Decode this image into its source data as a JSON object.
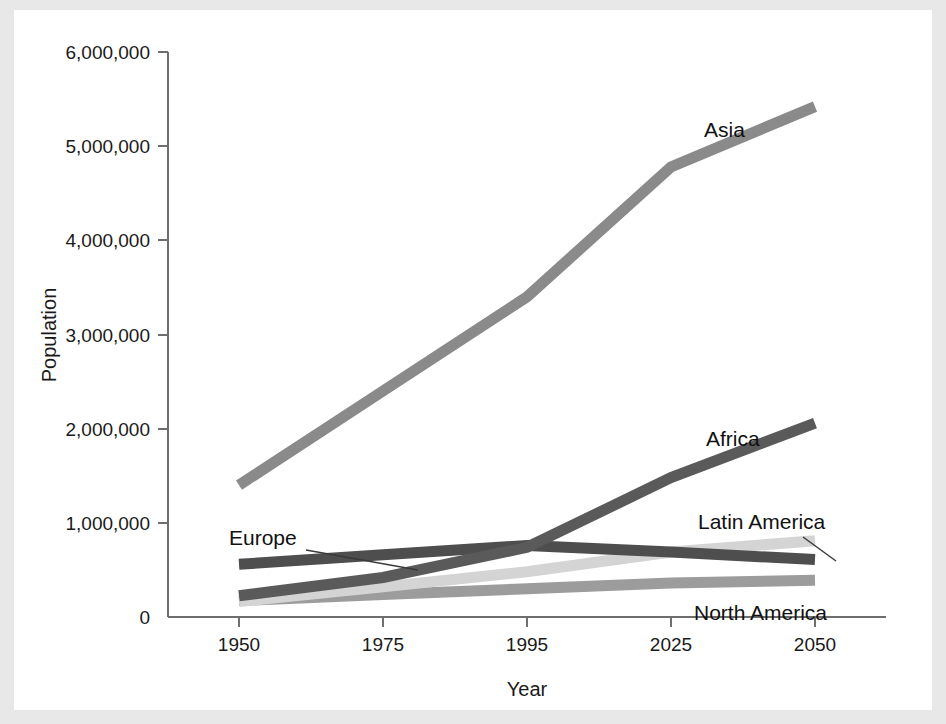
{
  "figure": {
    "background": "#ffffff",
    "page_background": "#e8e8e8"
  },
  "axes": {
    "x_title": "Year",
    "y_title": "Population",
    "x_ticks": [
      "1950",
      "1975",
      "1995",
      "2025",
      "2050"
    ],
    "y_ticks": [
      "0",
      "1,000,000",
      "2,000,000",
      "3,000,000",
      "4,000,000",
      "5,000,000",
      "6,000,000"
    ]
  },
  "labels": {
    "asia": "Asia",
    "africa": "Africa",
    "europe": "Europe",
    "latin_america": "Latin America",
    "north_america": "North America"
  },
  "colors": {
    "asia": "#8a8a8a",
    "africa": "#5a5a5a",
    "europe": "#4e4e4e",
    "latin_america": "#d4d4d4",
    "north_america": "#9c9c9c",
    "axis": "#6e6e6e",
    "text": "#111111"
  },
  "chart_data": {
    "type": "line",
    "title": "",
    "xlabel": "Year",
    "ylabel": "Population",
    "x": [
      1950,
      1975,
      1995,
      2025,
      2050
    ],
    "x_positions_categorical": true,
    "xtick_labels": [
      "1950",
      "1975",
      "1995",
      "2025",
      "2050"
    ],
    "ylim": [
      0,
      6000000
    ],
    "ytick_values": [
      0,
      1000000,
      2000000,
      3000000,
      4000000,
      5000000,
      6000000
    ],
    "grid": false,
    "legend": "inline-labels",
    "series": [
      {
        "name": "Asia",
        "color": "#8a8a8a",
        "values": [
          1400000,
          2400000,
          3400000,
          4780000,
          5420000
        ]
      },
      {
        "name": "Africa",
        "color": "#5a5a5a",
        "values": [
          225000,
          420000,
          740000,
          1480000,
          2060000
        ]
      },
      {
        "name": "Europe",
        "color": "#4e4e4e",
        "values": [
          560000,
          660000,
          760000,
          690000,
          610000
        ]
      },
      {
        "name": "Latin America",
        "color": "#d4d4d4",
        "values": [
          165000,
          320000,
          480000,
          690000,
          810000
        ]
      },
      {
        "name": "North America",
        "color": "#9c9c9c",
        "values": [
          175000,
          240000,
          300000,
          360000,
          390000
        ]
      }
    ],
    "annotations": [
      {
        "text": "Asia",
        "near_x": 2025,
        "near_y": 5150000
      },
      {
        "text": "Africa",
        "near_x": 2030,
        "near_y": 2080000
      },
      {
        "text": "Europe",
        "near_x": 1957,
        "near_y": 905000,
        "has_leader": true
      },
      {
        "text": "Latin America",
        "near_x": 2034,
        "near_y": 1090000,
        "has_leader": true
      },
      {
        "text": "North America",
        "near_x": 2028,
        "near_y": 130000
      }
    ]
  }
}
